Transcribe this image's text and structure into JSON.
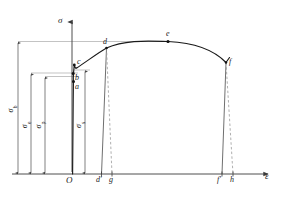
{
  "figure": {
    "type": "stress-strain-curve",
    "background_color": "#ffffff",
    "curve_color": "#1a1a1a",
    "guide_color": "#888888",
    "dash_color": "#9a9a9a"
  },
  "axes": {
    "y_label": "σ",
    "x_label": "ε",
    "origin_label": "O",
    "x_axis_y_px": 174,
    "y_axis_x_px": 72,
    "x_axis_start_px": 12,
    "x_axis_end_px": 272,
    "y_axis_top_px": 18
  },
  "points": [
    {
      "id": "a",
      "label": "a",
      "name": "proportional-limit-point",
      "x": 73.5,
      "y": 81.5,
      "label_x": 75,
      "label_y": 83
    },
    {
      "id": "b",
      "label": "b",
      "name": "elastic-limit-point",
      "x": 73.2,
      "y": 73.5,
      "label_x": 75,
      "label_y": 74
    },
    {
      "id": "c",
      "label": "c",
      "name": "yield-point",
      "x": 74.5,
      "y": 64.0,
      "label_x": 77,
      "label_y": 60
    },
    {
      "id": "d",
      "label": "d",
      "name": "strain-hardening-point",
      "x": 106.5,
      "y": 48.0,
      "label_x": 104,
      "label_y": 41
    },
    {
      "id": "e",
      "label": "e",
      "name": "ultimate-strength-point",
      "x": 168.0,
      "y": 41.5,
      "label_x": 166,
      "label_y": 33
    },
    {
      "id": "f",
      "label": "f",
      "name": "fracture-point",
      "x": 226.0,
      "y": 62.5,
      "label_x": 229,
      "label_y": 62
    }
  ],
  "x_ticks": [
    {
      "id": "d-prime",
      "label": "d′",
      "name": "permanent-strain-d-tick",
      "x": 101.5,
      "label_x": 96,
      "label_y": 176
    },
    {
      "id": "g",
      "label": "g",
      "name": "total-strain-d-tick",
      "x": 112.0,
      "label_x": 109,
      "label_y": 176
    },
    {
      "id": "f-prime",
      "label": "f′",
      "name": "permanent-strain-f-tick",
      "x": 222.0,
      "label_x": 218,
      "label_y": 176
    },
    {
      "id": "h",
      "label": "h",
      "name": "total-strain-f-tick",
      "x": 233.0,
      "label_x": 230,
      "label_y": 176
    }
  ],
  "stress_measures": [
    {
      "id": "sigma_b",
      "symbol": "σ",
      "subscript": "b",
      "name": "ultimate-tensile-strength",
      "arrow_x": 18,
      "top_y": 41.5,
      "label_x": 11,
      "label_y": 108,
      "guide_from_x": 18,
      "guide_to_x": 168
    },
    {
      "id": "sigma_e",
      "symbol": "σ",
      "subscript": "e",
      "name": "yield-strength",
      "arrow_x": 31,
      "top_y": 73.0,
      "label_x": 25,
      "label_y": 124,
      "guide_from_x": 31,
      "guide_to_x": 74
    },
    {
      "id": "sigma_p",
      "symbol": "σ",
      "subscript": "p",
      "name": "proportional-limit-stress",
      "arrow_x": 45,
      "top_y": 76.5,
      "label_x": 39,
      "label_y": 124,
      "guide_from_x": 45,
      "guide_to_x": 74
    },
    {
      "id": "sigma_s",
      "symbol": "σ",
      "subscript": "s",
      "name": "elastic-limit-stress",
      "arrow_x": 85,
      "top_y": 70.0,
      "label_x": 79,
      "label_y": 124,
      "guide_from_x": 74,
      "guide_to_x": 85
    }
  ],
  "curve_segments": {
    "elastic_path": "M 72.6,174 L 73.2,100 L 73.4,84 L 73.3,78 L 73.6,72",
    "yield_path": "M 73.6,72 L 74.0,68 L 74.3,64.5 L 74.8,66.5 L 75.6,68.2 L 76.6,68.0",
    "hardening_path": "M 76.6,68.0 C 86,62 97,53.5 106.5,48.0 C 125,39.5 148,41.0 168,41.5 C 190,42.5 212,48 226,62.5",
    "fracture_tail": "M 226,62.5 L 229.5,57.5",
    "unload_d_solid": "M 106.5,48.0 L 101.5,174",
    "unload_d_dash": "M 106.5,48.0 L 112.0,174",
    "unload_f_solid": "M 226,62.5 L 222.0,174",
    "unload_f_dash": "M 226,62.5 L 233.0,174"
  }
}
